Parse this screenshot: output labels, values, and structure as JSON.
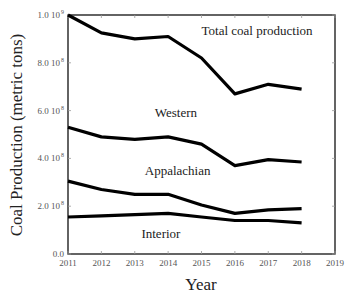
{
  "chart_data": {
    "type": "line",
    "title": "",
    "xlabel": "Year",
    "ylabel": "Coal Production (metric tons)",
    "x": [
      2011,
      2012,
      2013,
      2014,
      2015,
      2016,
      2017,
      2018
    ],
    "xlim": [
      2011,
      2019
    ],
    "ylim": [
      0,
      1000000000
    ],
    "x_ticks": [
      "2011",
      "2012",
      "2013",
      "2014",
      "2015",
      "2016",
      "2017",
      "2018",
      "2019"
    ],
    "y_ticks": [
      {
        "value": 0,
        "label": "0.0",
        "mantissa": "0.0",
        "exp": ""
      },
      {
        "value": 200000000,
        "label": "2.0 10^8",
        "mantissa": "2.0 10",
        "exp": "8"
      },
      {
        "value": 400000000,
        "label": "4.0 10^8",
        "mantissa": "4.0 10",
        "exp": "8"
      },
      {
        "value": 600000000,
        "label": "6.0 10^8",
        "mantissa": "6.0 10",
        "exp": "8"
      },
      {
        "value": 800000000,
        "label": "8.0 10^8",
        "mantissa": "8.0 10",
        "exp": "8"
      },
      {
        "value": 1000000000,
        "label": "1.0 10^9",
        "mantissa": "1.0 10",
        "exp": "9"
      }
    ],
    "grid": false,
    "legend": "inline labels",
    "series": [
      {
        "name": "Total coal production",
        "values": [
          1000000000,
          925000000,
          900000000,
          910000000,
          820000000,
          670000000,
          710000000,
          690000000
        ],
        "label_x": 2015.0,
        "label_y": 915000000
      },
      {
        "name": "Western",
        "values": [
          530000000,
          490000000,
          480000000,
          490000000,
          460000000,
          370000000,
          395000000,
          385000000
        ],
        "label_x": 2013.6,
        "label_y": 575000000
      },
      {
        "name": "Appalachian",
        "values": [
          305000000,
          270000000,
          250000000,
          250000000,
          205000000,
          170000000,
          185000000,
          190000000
        ],
        "label_x": 2013.3,
        "label_y": 330000000
      },
      {
        "name": "Interior",
        "values": [
          155000000,
          160000000,
          165000000,
          170000000,
          155000000,
          140000000,
          140000000,
          130000000
        ],
        "label_x": 2013.2,
        "label_y": 65000000
      }
    ],
    "line_color": "#000000"
  }
}
